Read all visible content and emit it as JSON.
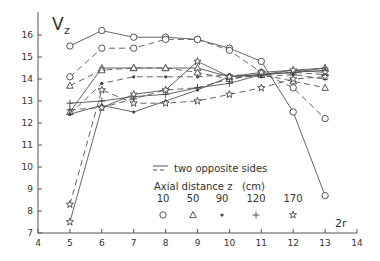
{
  "chart_data": {
    "type": "line",
    "title": "",
    "xlabel": "2r",
    "ylabel": "Vz",
    "xlim": [
      4,
      14
    ],
    "ylim": [
      7,
      16.7
    ],
    "x_ticks": [
      4,
      5,
      6,
      7,
      8,
      9,
      10,
      11,
      12,
      13,
      14
    ],
    "y_ticks": [
      7,
      8,
      9,
      10,
      11,
      12,
      13,
      14,
      15,
      16
    ],
    "grid": false,
    "legend": {
      "line_note": "two opposite sides",
      "title": "Axial distance z   (cm)",
      "entries": [
        {
          "z": "10",
          "marker": "circle"
        },
        {
          "z": "50",
          "marker": "triangle"
        },
        {
          "z": "90",
          "marker": "asterisk"
        },
        {
          "z": "120",
          "marker": "plus"
        },
        {
          "z": "170",
          "marker": "star"
        }
      ],
      "position": "lower center"
    },
    "x": [
      5,
      6,
      7,
      8,
      9,
      10,
      11,
      12,
      13
    ],
    "series": [
      {
        "name": "z=10 side A",
        "marker": "circle",
        "style": "solid",
        "values": [
          15.5,
          16.2,
          15.9,
          15.9,
          15.8,
          15.4,
          14.8,
          12.5,
          8.7
        ]
      },
      {
        "name": "z=10 side B",
        "marker": "circle",
        "style": "dashed",
        "values": [
          14.1,
          15.4,
          15.4,
          15.8,
          15.8,
          15.3,
          14.3,
          13.6,
          12.2
        ]
      },
      {
        "name": "z=50 side A",
        "marker": "triangle",
        "style": "solid",
        "values": [
          12.5,
          14.5,
          14.5,
          14.5,
          14.5,
          14.1,
          14.2,
          14.3,
          14.5
        ]
      },
      {
        "name": "z=50 side B",
        "marker": "triangle",
        "style": "dashed",
        "values": [
          13.7,
          14.4,
          14.5,
          14.5,
          14.3,
          14.0,
          14.2,
          13.9,
          13.6
        ]
      },
      {
        "name": "z=90 side A",
        "marker": "asterisk",
        "style": "solid",
        "values": [
          12.4,
          12.8,
          12.5,
          13.0,
          13.5,
          14.1,
          14.2,
          14.3,
          14.4
        ]
      },
      {
        "name": "z=90 side B",
        "marker": "asterisk",
        "style": "dashed",
        "values": [
          12.4,
          13.8,
          14.1,
          14.1,
          14.1,
          14.2,
          14.1,
          14.2,
          14.0
        ]
      },
      {
        "name": "z=120 side A",
        "marker": "plus",
        "style": "solid",
        "values": [
          12.9,
          13.0,
          13.2,
          13.3,
          13.6,
          13.8,
          14.2,
          14.4,
          14.5
        ]
      },
      {
        "name": "z=120 side B",
        "marker": "plus",
        "style": "dashed",
        "values": [
          12.6,
          12.7,
          13.1,
          13.5,
          13.6,
          14.0,
          14.2,
          14.3,
          14.2
        ]
      },
      {
        "name": "z=170 side A",
        "marker": "star",
        "style": "solid",
        "values": [
          7.5,
          12.7,
          13.3,
          13.5,
          14.8,
          14.1,
          14.3,
          14.4,
          14.3
        ]
      },
      {
        "name": "z=170 side B",
        "marker": "star",
        "style": "dashed",
        "values": [
          8.3,
          13.5,
          12.9,
          12.9,
          13.0,
          13.3,
          13.6,
          14.0,
          14.1
        ]
      }
    ]
  }
}
